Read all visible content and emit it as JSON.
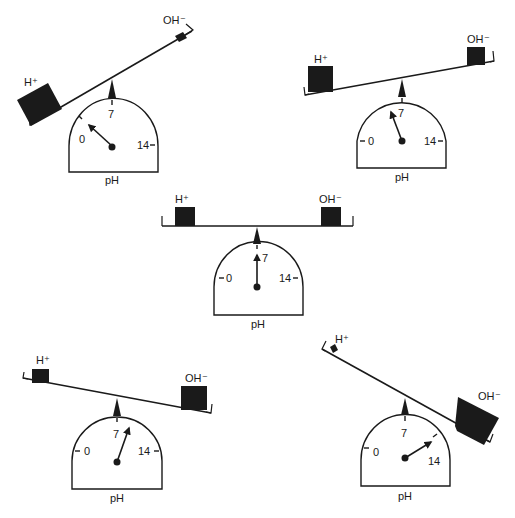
{
  "figure": {
    "colors": {
      "ink": "#1a1a1a",
      "background": "#ffffff"
    },
    "dial_labels": {
      "min": "0",
      "mid": "7",
      "max": "14",
      "unit": "pH"
    },
    "ion_labels": {
      "acid": "H⁺",
      "base": "OH⁻"
    },
    "scales": [
      {
        "id": "very-acidic",
        "position": "top-left",
        "h_amount": "large",
        "oh_amount": "small",
        "tilt": "down-left steep",
        "needle_reading": "≈0.5"
      },
      {
        "id": "slightly-acidic",
        "position": "top-right",
        "h_amount": "medium-large",
        "oh_amount": "medium-small",
        "tilt": "down-left slight",
        "needle_reading": "≈6"
      },
      {
        "id": "neutral",
        "position": "center",
        "h_amount": "equal",
        "oh_amount": "equal",
        "tilt": "level",
        "needle_reading": "7"
      },
      {
        "id": "slightly-basic",
        "position": "bottom-left",
        "h_amount": "medium-small",
        "oh_amount": "medium-large",
        "tilt": "down-right slight",
        "needle_reading": "≈8"
      },
      {
        "id": "very-basic",
        "position": "bottom-right",
        "h_amount": "small",
        "oh_amount": "large",
        "tilt": "down-right steep",
        "needle_reading": "≈13"
      }
    ]
  }
}
